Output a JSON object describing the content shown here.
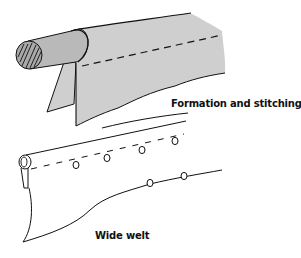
{
  "figures": [
    {
      "id": "formation",
      "caption": "Formation and stitching"
    },
    {
      "id": "wide-welt",
      "caption": "Wide welt"
    }
  ],
  "colors": {
    "background": "#ffffff",
    "fabric_fill": "#cfcfcf",
    "rod_fill": "#b9b9b9",
    "rod_end_fill": "#a9a9a9",
    "stroke": "#111111"
  }
}
